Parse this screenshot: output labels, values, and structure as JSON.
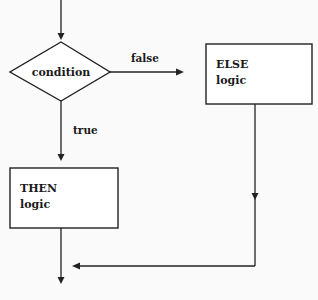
{
  "diagram": {
    "type": "flowchart",
    "nodes": [
      {
        "id": "condition",
        "shape": "diamond",
        "label": "condition"
      },
      {
        "id": "else",
        "shape": "rectangle",
        "lines": [
          "ELSE",
          "logic"
        ]
      },
      {
        "id": "then",
        "shape": "rectangle",
        "lines": [
          "THEN",
          "logic"
        ]
      }
    ],
    "edges": [
      {
        "from": "entry",
        "to": "condition",
        "label": ""
      },
      {
        "from": "condition",
        "to": "else",
        "label": "false"
      },
      {
        "from": "condition",
        "to": "then",
        "label": "true"
      },
      {
        "from": "else",
        "to": "merge",
        "label": ""
      },
      {
        "from": "then",
        "to": "exit",
        "label": ""
      }
    ],
    "labels": {
      "condition": "condition",
      "false_edge": "false",
      "true_edge": "true",
      "else_title": "ELSE",
      "else_body": "logic",
      "then_title": "THEN",
      "then_body": "logic"
    },
    "colors": {
      "stroke": "#222222",
      "background": "#fafafa",
      "fill": "#ffffff"
    }
  }
}
